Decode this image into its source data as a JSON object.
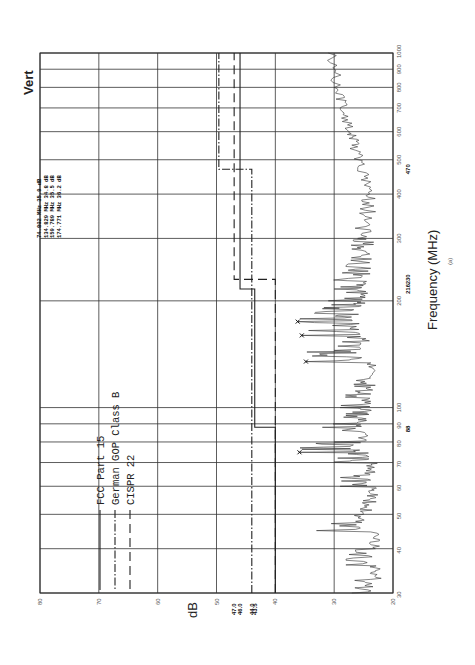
{
  "chart_data": {
    "type": "line",
    "orientation": "rotated-90 (frequency axis vertical on right, dB axis horizontal at bottom, reversed)",
    "title": "",
    "corner_label": "Vert",
    "xlabel": "Frequency (MHz)",
    "ylabel": "dB",
    "caption": "(a)",
    "x_scale": "log",
    "xlim": [
      30,
      1000
    ],
    "ylim": [
      20,
      80
    ],
    "x_ticks": [
      30,
      40,
      50,
      60,
      70,
      80,
      90,
      100,
      200,
      300,
      400,
      500,
      600,
      700,
      800,
      900,
      1000
    ],
    "y_ticks": [
      20,
      30,
      40,
      50,
      60,
      70,
      80
    ],
    "extra_x_ticks": [
      88,
      216,
      230,
      470
    ],
    "extra_y_ticks": [
      47.0,
      46.0,
      44.0,
      43.5
    ],
    "grid": true,
    "legend": [
      {
        "label": "FCC Part 15",
        "style": "solid"
      },
      {
        "label": "German GOP Class B",
        "style": "dash-dot"
      },
      {
        "label": "CISPR 22",
        "style": "dashed"
      }
    ],
    "series": [
      {
        "name": "FCC Part 15",
        "style": "solid",
        "steps": [
          [
            30,
            88,
            40.0
          ],
          [
            88,
            216,
            43.5
          ],
          [
            216,
            1000,
            46.0
          ]
        ]
      },
      {
        "name": "German GOP Class B",
        "style": "dash-dot",
        "steps": [
          [
            30,
            230,
            44.0
          ],
          [
            230,
            470,
            44.0
          ],
          [
            470,
            1000,
            49.6
          ]
        ]
      },
      {
        "name": "CISPR 22",
        "style": "dashed",
        "steps": [
          [
            30,
            230,
            40.0
          ],
          [
            230,
            1000,
            47.0
          ]
        ]
      },
      {
        "name": "Measured emission (approx.)",
        "style": "spectrum",
        "x": [
          30,
          33,
          36,
          40,
          45,
          50,
          55,
          60,
          65,
          70,
          74.8,
          80,
          88,
          95,
          100,
          110,
          120,
          134.8,
          145,
          159.8,
          174.8,
          190,
          200,
          216,
          230,
          250,
          280,
          300,
          350,
          400,
          470,
          550,
          600,
          700,
          800,
          1000
        ],
        "y": [
          27,
          22,
          28,
          23,
          33,
          25,
          24,
          29,
          24,
          30,
          35.9,
          30,
          32,
          28,
          29,
          26,
          25,
          34.8,
          30,
          35.5,
          36.2,
          32,
          31,
          30,
          29,
          28,
          27,
          26,
          25,
          24,
          26,
          27,
          27.5,
          29,
          30,
          31
        ]
      }
    ],
    "markers": [
      {
        "freq_mhz": 74.802,
        "level_db": 35.9
      },
      {
        "freq_mhz": 134.829,
        "level_db": 34.8
      },
      {
        "freq_mhz": 159.789,
        "level_db": 35.5
      },
      {
        "freq_mhz": 174.771,
        "level_db": 36.2
      }
    ],
    "readout": [
      "74.802 MHz   35.9 dB",
      "134.829 MHz   34.8 dB",
      "159.789 MHz   35.5 dB",
      "174.771 MHz   36.2 dB"
    ]
  }
}
